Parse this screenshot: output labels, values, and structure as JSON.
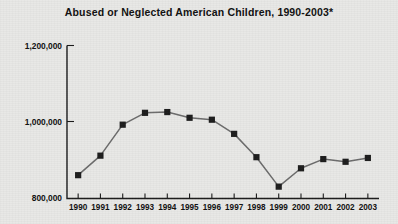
{
  "chart_data": {
    "type": "line",
    "title": "Abused or Neglected American Children, 1990-2003*",
    "xlabel": "",
    "ylabel": "",
    "categories": [
      "1990",
      "1991",
      "1992",
      "1993",
      "1994",
      "1995",
      "1996",
      "1997",
      "1998",
      "1999",
      "2000",
      "2001",
      "2002",
      "2003"
    ],
    "values": [
      861000,
      912000,
      993000,
      1024000,
      1026000,
      1011000,
      1006000,
      969000,
      908000,
      831000,
      879000,
      903000,
      896000,
      906000
    ],
    "series": [
      {
        "name": "Abused or neglected children",
        "values": [
          861000,
          912000,
          993000,
          1024000,
          1026000,
          1011000,
          1006000,
          969000,
          908000,
          831000,
          879000,
          903000,
          896000,
          906000
        ]
      }
    ],
    "ylim": [
      800000,
      1200000
    ],
    "y_ticks": [
      800000,
      1000000,
      1200000
    ],
    "y_tick_labels": [
      "800,000",
      "1,000,000",
      "1,200,000"
    ],
    "grid": false,
    "legend": false,
    "marker": "square",
    "colors": {
      "line": "#6b6b6b",
      "marker": "#1c1c1c",
      "axis": "#1a1a1a",
      "background": "#e8e8e6",
      "text": "#101010"
    },
    "footnote_symbol": "*"
  }
}
